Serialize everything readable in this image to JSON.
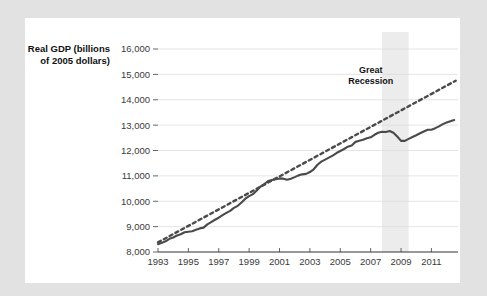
{
  "figure": {
    "background_color": "#e2e2e2",
    "card_color": "#ffffff",
    "line_color": "#4a4a4a",
    "grid_color": "#dddddd",
    "band_color": "#ececec"
  },
  "chart_data": {
    "type": "line",
    "title": "",
    "xlabel": "",
    "ylabel": "Real GDP (billions of 2005 dollars)",
    "ylabel_line1": "Real GDP (billions",
    "ylabel_line2": "of 2005 dollars)",
    "xlim": [
      1993,
      2012.75
    ],
    "ylim": [
      8000,
      16000
    ],
    "grid": true,
    "legend_position": "none",
    "y_ticks": [
      8000,
      9000,
      10000,
      11000,
      12000,
      13000,
      14000,
      15000,
      16000
    ],
    "y_tick_labels": [
      "8,000",
      "9,000",
      "10,000",
      "11,000",
      "12,000",
      "13,000",
      "14,000",
      "15,000",
      "16,000"
    ],
    "x_ticks": [
      1993,
      1995,
      1997,
      1999,
      2001,
      2003,
      2005,
      2007,
      2009,
      2011
    ],
    "x_tick_labels": [
      "1993",
      "1995",
      "1997",
      "1999",
      "2001",
      "2003",
      "2005",
      "2007",
      "2009",
      "2011"
    ],
    "annotations": [
      {
        "name": "great-recession",
        "text": "Great Recession",
        "line1": "Great",
        "line2": "Recession",
        "x_start": 2007.75,
        "x_end": 2009.5,
        "label_x": 2007.0,
        "label_y": 15050
      }
    ],
    "series": [
      {
        "name": "Real GDP",
        "style": "solid",
        "x": [
          1993.0,
          1993.25,
          1993.5,
          1993.75,
          1994.0,
          1994.25,
          1994.5,
          1994.75,
          1995.0,
          1995.25,
          1995.5,
          1995.75,
          1996.0,
          1996.25,
          1996.5,
          1996.75,
          1997.0,
          1997.25,
          1997.5,
          1997.75,
          1998.0,
          1998.25,
          1998.5,
          1998.75,
          1999.0,
          1999.25,
          1999.5,
          1999.75,
          2000.0,
          2000.25,
          2000.5,
          2000.75,
          2001.0,
          2001.25,
          2001.5,
          2001.75,
          2002.0,
          2002.25,
          2002.5,
          2002.75,
          2003.0,
          2003.25,
          2003.5,
          2003.75,
          2004.0,
          2004.25,
          2004.5,
          2004.75,
          2005.0,
          2005.25,
          2005.5,
          2005.75,
          2006.0,
          2006.25,
          2006.5,
          2006.75,
          2007.0,
          2007.25,
          2007.5,
          2007.75,
          2008.0,
          2008.25,
          2008.5,
          2008.75,
          2009.0,
          2009.25,
          2009.5,
          2009.75,
          2010.0,
          2010.25,
          2010.5,
          2010.75,
          2011.0,
          2011.25,
          2011.5,
          2011.75,
          2012.0,
          2012.25,
          2012.5
        ],
        "values": [
          8310,
          8360,
          8420,
          8520,
          8570,
          8650,
          8700,
          8780,
          8800,
          8820,
          8880,
          8930,
          8960,
          9090,
          9180,
          9270,
          9350,
          9450,
          9540,
          9620,
          9740,
          9820,
          9950,
          10100,
          10200,
          10280,
          10420,
          10580,
          10680,
          10800,
          10840,
          10870,
          10900,
          10890,
          10850,
          10890,
          10950,
          11020,
          11060,
          11080,
          11150,
          11260,
          11440,
          11560,
          11640,
          11720,
          11800,
          11900,
          11980,
          12060,
          12150,
          12200,
          12340,
          12380,
          12420,
          12480,
          12520,
          12620,
          12700,
          12740,
          12730,
          12770,
          12700,
          12550,
          12380,
          12380,
          12460,
          12530,
          12600,
          12680,
          12750,
          12820,
          12820,
          12880,
          12950,
          13040,
          13100,
          13150,
          13200
        ]
      },
      {
        "name": "Potential output trend",
        "style": "dotted",
        "x": [
          1993.0,
          2012.6
        ],
        "values": [
          8380,
          14750
        ]
      }
    ]
  }
}
